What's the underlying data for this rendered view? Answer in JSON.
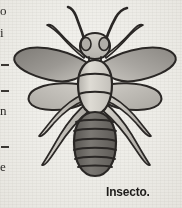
{
  "page": {
    "background_color": "#efeeea",
    "ink_color": "#2b2926"
  },
  "edge_column": {
    "description": "partially cut-off text column at the left page margin",
    "glyphs": [
      {
        "char": "o",
        "top": 6,
        "type": "letter"
      },
      {
        "char": "i",
        "top": 28,
        "type": "letter"
      },
      {
        "char": "-",
        "top": 58,
        "type": "dash"
      },
      {
        "char": "-",
        "top": 86,
        "type": "dash"
      },
      {
        "char": "n",
        "top": 106,
        "type": "letter"
      },
      {
        "char": "-",
        "top": 140,
        "type": "dash"
      },
      {
        "char": "e",
        "top": 162,
        "type": "letter"
      }
    ]
  },
  "illustration": {
    "subject": "insect",
    "style": "engraving",
    "colors": {
      "outline": "#2a2725",
      "wing_fill_dark": "#8e8b86",
      "wing_fill_light": "#b9b6b0",
      "thorax_fill": "#d3d0c9",
      "abdomen_fill": "#6d6a65",
      "head_fill": "#c9c6bf",
      "leg_fill": "#c2bfb8"
    },
    "parts": {
      "antennae": 2,
      "wings": 4,
      "legs": 6,
      "abdomen_segments": 7,
      "thorax_bands": 2,
      "eyes": 2
    }
  },
  "caption": {
    "text": "Insecto.",
    "color": "#1d1b19"
  }
}
